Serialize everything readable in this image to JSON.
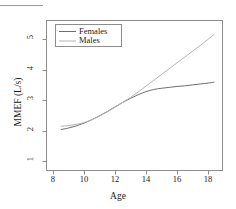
{
  "chart_data": {
    "type": "line",
    "title": "",
    "xlabel": "Age",
    "ylabel": "MMEF (L/s)",
    "xlim": [
      7.55,
      18.9
    ],
    "ylim": [
      0.72,
      5.62
    ],
    "xticks": [
      8,
      10,
      12,
      14,
      16,
      18
    ],
    "xtick_labels": [
      "8",
      "10",
      "12",
      "14",
      "16",
      "18"
    ],
    "yticks": [
      1,
      2,
      3,
      4,
      5
    ],
    "ytick_labels": [
      "1",
      "2",
      "3",
      "4",
      "5"
    ],
    "grid": false,
    "legend_position": "top-left",
    "frame": true,
    "series": [
      {
        "name": "Females",
        "color": "#6e6e6e",
        "x": [
          8.5,
          9.0,
          9.5,
          10.0,
          10.5,
          11.0,
          11.5,
          12.0,
          12.5,
          13.0,
          13.5,
          14.0,
          14.5,
          15.0,
          15.5,
          16.0,
          16.5,
          17.0,
          17.5,
          18.0,
          18.4
        ],
        "y": [
          2.04,
          2.09,
          2.16,
          2.25,
          2.36,
          2.49,
          2.63,
          2.78,
          2.93,
          3.06,
          3.18,
          3.28,
          3.35,
          3.39,
          3.42,
          3.45,
          3.47,
          3.5,
          3.53,
          3.56,
          3.59
        ]
      },
      {
        "name": "Males",
        "color": "#b4b4b4",
        "x": [
          8.5,
          9.0,
          9.5,
          10.0,
          10.5,
          11.0,
          11.5,
          12.0,
          12.5,
          13.0,
          13.5,
          14.0,
          14.5,
          15.0,
          15.5,
          16.0,
          16.5,
          17.0,
          17.5,
          18.0,
          18.4
        ],
        "y": [
          2.15,
          2.17,
          2.21,
          2.27,
          2.36,
          2.48,
          2.62,
          2.77,
          2.93,
          3.09,
          3.27,
          3.46,
          3.65,
          3.84,
          4.03,
          4.22,
          4.41,
          4.6,
          4.79,
          4.99,
          5.15
        ]
      }
    ]
  },
  "legend": {
    "entries": [
      {
        "label": "Females",
        "color": "#6e6e6e"
      },
      {
        "label": "Males",
        "color": "#b4b4b4"
      }
    ]
  },
  "axes": {
    "x_title": "Age",
    "y_title": "MMEF (L/s)",
    "x_tick_labels": [
      "8",
      "10",
      "12",
      "14",
      "16",
      "18"
    ],
    "y_tick_labels": [
      "1",
      "2",
      "3",
      "4",
      "5"
    ]
  },
  "style": {
    "frame_color": "#8c8c8c",
    "text_color": "#1a1a1a",
    "background": "#ffffff",
    "top_rule_color": "#9a9a9a"
  }
}
